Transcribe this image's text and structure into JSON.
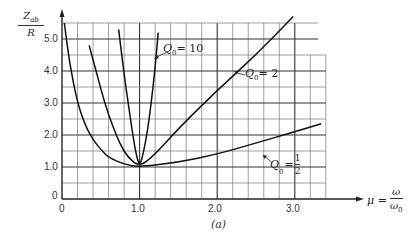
{
  "chart_data": {
    "type": "line",
    "title": "",
    "caption": "(a)",
    "xlabel": "μ = ω/ω₀",
    "ylabel": "Z_ab / R",
    "xlim": [
      0,
      3.4
    ],
    "ylim": [
      0,
      5.6
    ],
    "x_ticks": [
      "0",
      "1.0",
      "2.0",
      "3.0"
    ],
    "y_ticks": [
      "0",
      "1.0",
      "2.0",
      "3.0",
      "4.0",
      "5.0"
    ],
    "grid": true,
    "grid_x_step": 0.2,
    "grid_y_step": 0.5,
    "legend_position": "inline curve labels",
    "series": [
      {
        "name": "Q0 = 10",
        "points": [
          [
            0.73,
            5.3
          ],
          [
            0.8,
            3.9
          ],
          [
            0.85,
            3.05
          ],
          [
            0.9,
            2.2
          ],
          [
            0.95,
            1.45
          ],
          [
            1.0,
            1.0
          ],
          [
            1.05,
            1.45
          ],
          [
            1.1,
            2.1
          ],
          [
            1.15,
            3.0
          ],
          [
            1.2,
            4.1
          ],
          [
            1.24,
            5.2
          ]
        ]
      },
      {
        "name": "Q0 = 2",
        "points": [
          [
            0.35,
            4.8
          ],
          [
            0.45,
            3.9
          ],
          [
            0.55,
            3.0
          ],
          [
            0.65,
            2.3
          ],
          [
            0.75,
            1.7
          ],
          [
            0.85,
            1.3
          ],
          [
            1.0,
            1.0
          ],
          [
            1.2,
            1.4
          ],
          [
            1.5,
            2.2
          ],
          [
            2.0,
            3.4
          ],
          [
            2.5,
            4.5
          ],
          [
            2.98,
            5.7
          ]
        ]
      },
      {
        "name": "Q0 = 1/2",
        "points": [
          [
            0.03,
            5.5
          ],
          [
            0.1,
            4.2
          ],
          [
            0.2,
            3.0
          ],
          [
            0.3,
            2.3
          ],
          [
            0.4,
            1.85
          ],
          [
            0.5,
            1.55
          ],
          [
            0.6,
            1.3
          ],
          [
            0.8,
            1.08
          ],
          [
            1.0,
            1.0
          ],
          [
            1.5,
            1.15
          ],
          [
            2.0,
            1.4
          ],
          [
            2.5,
            1.75
          ],
          [
            3.0,
            2.1
          ],
          [
            3.34,
            2.35
          ]
        ]
      }
    ]
  },
  "labels": {
    "y_axis_num": "Z",
    "y_axis_sub": "ab",
    "y_axis_den": "R",
    "x_axis_mu": "μ =",
    "x_axis_num": "ω",
    "x_axis_den": "ω",
    "x_axis_den_sub": "0",
    "curve_q10": "Q",
    "curve_q10_sub": "0",
    "curve_q10_val": "= 10",
    "curve_q2": "Q",
    "curve_q2_sub": "0",
    "curve_q2_val": "= 2",
    "curve_qhalf": "Q",
    "curve_qhalf_sub": "0",
    "curve_qhalf_eq": "=",
    "curve_qhalf_num": "1",
    "curve_qhalf_den": "2",
    "caption": "(a)",
    "ytick_0": "0",
    "ytick_1": "1.0",
    "ytick_2": "2.0",
    "ytick_3": "3.0",
    "ytick_4": "4.0",
    "ytick_5": "5.0",
    "xtick_0": "0",
    "xtick_1": "1.0",
    "xtick_2": "2.0",
    "xtick_3": "3.0"
  }
}
